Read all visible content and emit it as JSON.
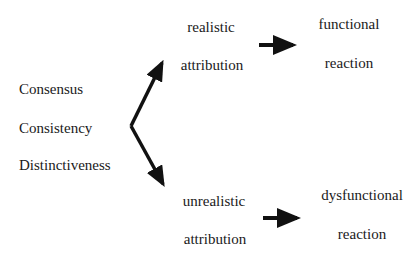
{
  "factors": [
    "Consensus",
    "Consistency",
    "Distinctiveness"
  ],
  "realistic": {
    "line1": "realistic",
    "line2": "attribution"
  },
  "functional": {
    "line1": "functional",
    "line2": "reaction"
  },
  "unrealistic": {
    "line1": "unrealistic",
    "line2": "attribution"
  },
  "dysfunctional": {
    "line1": "dysfunctional",
    "line2": "reaction"
  },
  "colors": {
    "text": "#1a1a1a",
    "arrow": "#111111",
    "background": "#ffffff"
  }
}
